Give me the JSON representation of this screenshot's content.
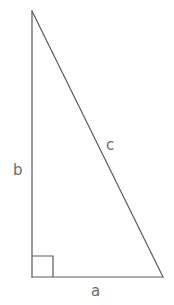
{
  "figure": {
    "kind": "right-triangle-diagram",
    "background_color": "#ffffff",
    "stroke_color": "#5a5a5a",
    "label_color": "#6b6b6b",
    "stroke_width": 1.2,
    "canvas": {
      "width": 174,
      "height": 305
    },
    "vertices": {
      "apex": {
        "x": 32,
        "y": 11
      },
      "bottom_left": {
        "x": 32,
        "y": 277
      },
      "bottom_right": {
        "x": 163,
        "y": 277
      }
    },
    "right_angle_marker": {
      "corner": "bottom-left",
      "size": 21,
      "x": 32,
      "y": 256
    },
    "labels": {
      "vertical_leg": "b",
      "hypotenuse": "c",
      "horizontal_leg": "a"
    }
  }
}
